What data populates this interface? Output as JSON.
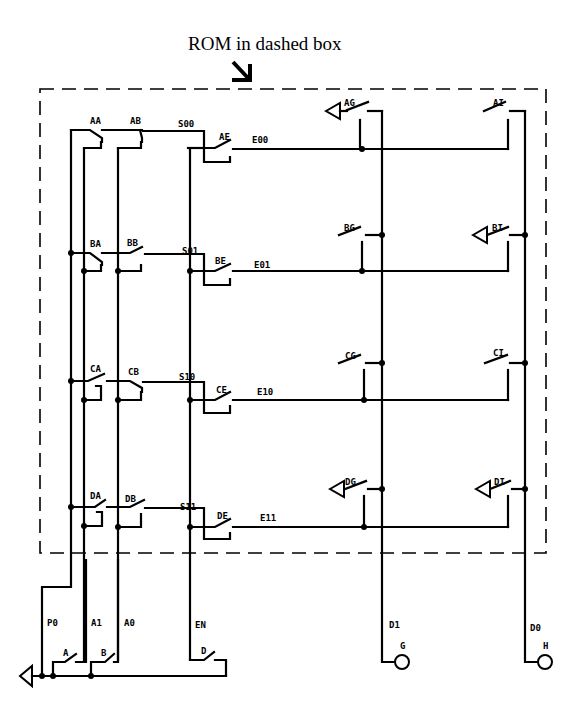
{
  "annotation": {
    "title": "ROM in dashed box",
    "arrow": "arrow-down-right"
  },
  "rom": {
    "rows": [
      {
        "id": "row-00",
        "sel_a": "AA",
        "sel_b": "AB",
        "select": "S00",
        "enable_switch": "AE",
        "enable": "E00",
        "data_g": "AG",
        "data_i": "AI",
        "g_grounded": true,
        "i_grounded": false
      },
      {
        "id": "row-01",
        "sel_a": "BA",
        "sel_b": "BB",
        "select": "S01",
        "enable_switch": "BE",
        "enable": "E01",
        "data_g": "BG",
        "data_i": "BI",
        "g_grounded": false,
        "i_grounded": true
      },
      {
        "id": "row-10",
        "sel_a": "CA",
        "sel_b": "CB",
        "select": "S10",
        "enable_switch": "CE",
        "enable": "E10",
        "data_g": "CG",
        "data_i": "CI",
        "g_grounded": false,
        "i_grounded": false
      },
      {
        "id": "row-11",
        "sel_a": "DA",
        "sel_b": "DB",
        "select": "S11",
        "enable_switch": "DE",
        "enable": "E11",
        "data_g": "DG",
        "data_i": "DI",
        "g_grounded": true,
        "i_grounded": true
      }
    ]
  },
  "inputs": {
    "power": "P0",
    "address_1": "A1",
    "address_0": "A0",
    "enable": "EN",
    "switch_a": "A",
    "switch_b": "B",
    "switch_d": "D"
  },
  "outputs": {
    "data_1": "D1",
    "data_0": "D0",
    "lamp_g": "G",
    "lamp_h": "H"
  }
}
